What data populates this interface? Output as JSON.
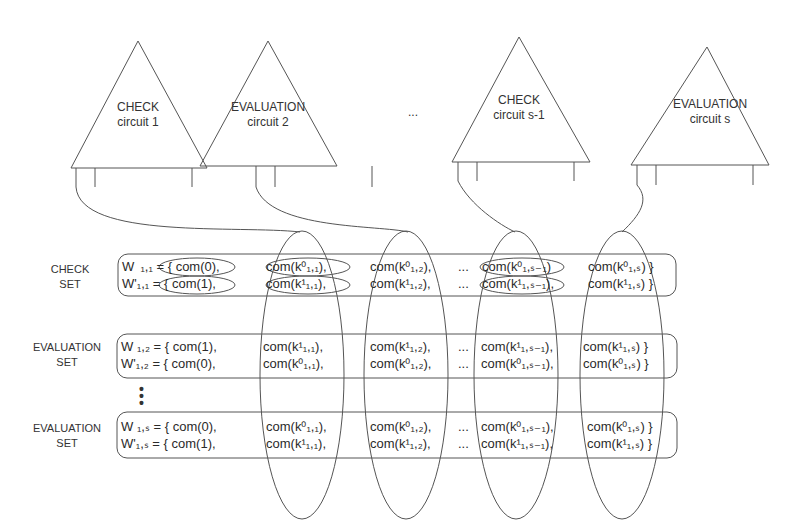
{
  "circuits": [
    {
      "line1": "CHECK",
      "line2": "circuit 1"
    },
    {
      "line1": "EVALUATION",
      "line2": "circuit 2"
    },
    {
      "line1": "CHECK",
      "line2": "circuit s-1"
    },
    {
      "line1": "EVALUATION",
      "line2": "circuit s"
    }
  ],
  "ellipsis": "...",
  "sets": [
    {
      "label1": "CHECK",
      "label2": "SET",
      "rows": [
        {
          "w": "W  ₁,₁ = { com(0),",
          "c1": "com(k⁰₁,₁),",
          "c2": "com(k⁰₁,₂),",
          "dots": "...",
          "c3": "com(k⁰₁,ₛ₋₁)",
          "c4": "com(k⁰₁,ₛ) }"
        },
        {
          "w": "W'₁,₁ = { com(1),",
          "c1": "com(k¹₁,₁),",
          "c2": "com(k¹₁,₂),",
          "dots": "...",
          "c3": "com(k¹₁,ₛ₋₁),",
          "c4": "com(k¹₁,ₛ) }"
        }
      ]
    },
    {
      "label1": "EVALUATION",
      "label2": "SET",
      "rows": [
        {
          "w": "W ₁,₂ = { com(1),",
          "c1": "com(k¹₁,₁),",
          "c2": "com(k¹₁,₂),",
          "dots": "...",
          "c3": "com(k¹₁,ₛ₋₁),",
          "c4": "com(k¹₁,ₛ) }"
        },
        {
          "w": "W'₁,₂ = { com(0),",
          "c1": "com(k⁰₁,₁),",
          "c2": "com(k⁰₁,₂),",
          "dots": "...",
          "c3": "com(k⁰₁,ₛ₋₁),",
          "c4": "com(k⁰₁,ₛ) }"
        }
      ]
    },
    {
      "label1": "EVALUATION",
      "label2": "SET",
      "rows": [
        {
          "w": "W ₁,ₛ = { com(0),",
          "c1": "com(k⁰₁,₁),",
          "c2": "com(k⁰₁,₂),",
          "dots": "...",
          "c3": "com(k⁰₁,ₛ₋₁),",
          "c4": "com(k⁰₁,ₛ) }"
        },
        {
          "w": "W'₁,ₛ = { com(1),",
          "c1": "com(k¹₁,₁),",
          "c2": "com(k¹₁,₂),",
          "dots": "...",
          "c3": "com(k¹₁,ₛ₋₁),",
          "c4": "com(k¹₁,ₛ) }"
        }
      ]
    }
  ],
  "vertical_ellipsis": "•\n•\n•"
}
